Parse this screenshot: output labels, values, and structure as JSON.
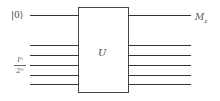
{
  "diagram": {
    "type": "quantum-circuit",
    "gate": {
      "label": "U"
    },
    "inputs": {
      "top_qubit": {
        "label": "|0⟩"
      },
      "register": {
        "numerator": "Iⁿ",
        "denominator": "2ⁿ",
        "wire_count": 5
      }
    },
    "outputs": {
      "top_qubit": {
        "label": "M_z",
        "display": "Mz"
      },
      "register": {
        "wire_count": 5
      }
    },
    "colors": {
      "wire": "#333333",
      "box_border": "#444444",
      "text": "#444444",
      "background": "#ffffff"
    }
  }
}
